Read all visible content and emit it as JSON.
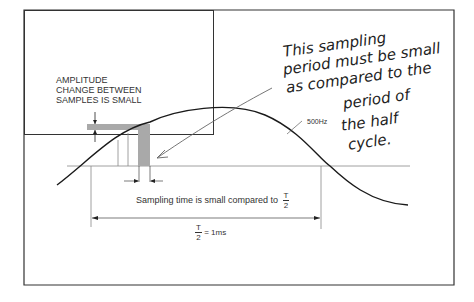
{
  "diagram": {
    "amplitude_label": [
      "AMPLITUDE",
      "CHANGE BETWEEN",
      "SAMPLES IS SMALL"
    ],
    "handwritten_note": [
      "This sampling",
      "period must be small",
      "as compared to the",
      "period of",
      "the half",
      "cycle."
    ],
    "frequency_label": "500Hz",
    "sampling_time_label": "Sampling time is small compared to",
    "sampling_fraction": {
      "numerator": "T",
      "denominator": "2"
    },
    "half_period_label": {
      "numerator": "T",
      "denominator": "2",
      "value": "= 1ms"
    },
    "colors": {
      "frame": "#333333",
      "curve": "#1a1a1a",
      "sample_fill": "#a9a9a9",
      "axis": "#888888"
    }
  }
}
